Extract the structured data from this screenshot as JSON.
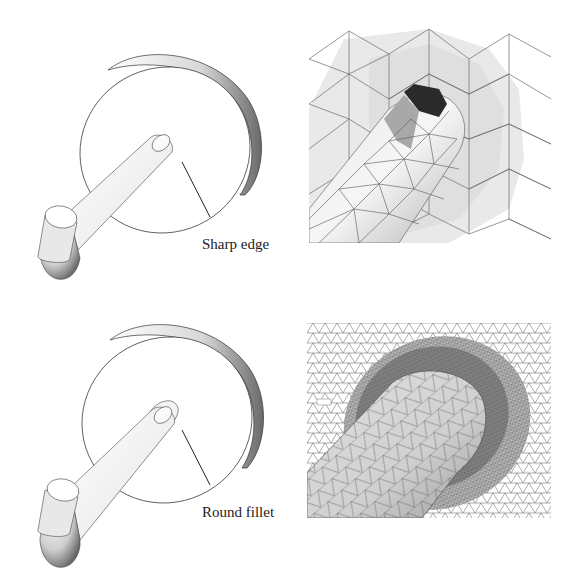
{
  "figure": {
    "panels": [
      {
        "id": "top-left",
        "kind": "cad-model",
        "annotation": "Sharp edge",
        "description": "Disk with cylindrical rod joined by a sharp edge"
      },
      {
        "id": "top-right",
        "kind": "mesh-closeup",
        "description": "Coarse triangular surface mesh around sharp-edge junction"
      },
      {
        "id": "bottom-left",
        "kind": "cad-model",
        "annotation": "Round fillet",
        "description": "Disk with cylindrical rod joined by a rounded fillet"
      },
      {
        "id": "bottom-right",
        "kind": "mesh-closeup",
        "description": "Refined triangular surface mesh around fillet junction"
      }
    ]
  },
  "labels": {
    "sharp_edge": "Sharp edge",
    "round_fillet": "Round fillet"
  },
  "colors": {
    "background": "#ffffff",
    "outline": "#333333",
    "mesh_line": "#555555",
    "surface_light": "#f2f2f2",
    "surface_shade": "#9a9a9a",
    "dark_face": "#2a2a2a"
  }
}
